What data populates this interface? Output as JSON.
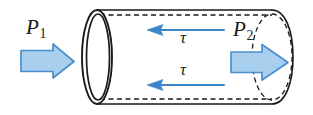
{
  "figure": {
    "canvas": {
      "width": 313,
      "height": 115,
      "background": "#ffffff"
    },
    "labels": {
      "p1": {
        "symbol": "P",
        "subscript": "1",
        "text": "P1"
      },
      "p2": {
        "symbol": "P",
        "subscript": "2",
        "text": "P2"
      },
      "tau_top": "τ",
      "tau_bottom": "τ"
    },
    "colors": {
      "arrow_fill": "#a9cfee",
      "arrow_stroke": "#4a8fcb",
      "shear_arrow": "#3a86c8",
      "outline": "#1a1a1a",
      "label_text": "#1a1a1a",
      "background": "#ffffff"
    },
    "elements": {
      "pressure_arrow_left": {
        "name": "P1",
        "direction": "right",
        "style": "block-arrow",
        "fill": "#a9cfee",
        "stroke": "#4a8fcb"
      },
      "pressure_arrow_right": {
        "name": "P2",
        "direction": "right",
        "style": "block-arrow",
        "fill": "#a9cfee",
        "stroke": "#4a8fcb"
      },
      "shear_arrow_top": {
        "name": "tau-top",
        "direction": "left",
        "style": "line-arrow",
        "color": "#3a86c8"
      },
      "shear_arrow_bottom": {
        "name": "tau-bottom",
        "direction": "left",
        "style": "line-arrow",
        "color": "#3a86c8"
      },
      "cylinder": {
        "left_end": "solid double ellipse (open tube mouth)",
        "right_end": "dashed ellipse (hidden far end)",
        "top_wall": "solid outer line with dashed inner line",
        "bottom_wall": "solid outer line with dashed inner line"
      }
    }
  }
}
